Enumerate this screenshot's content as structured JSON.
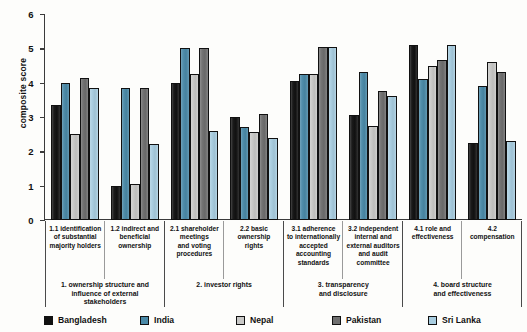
{
  "chart_data": {
    "type": "bar",
    "title": "",
    "xlabel": "",
    "ylabel": "composite score",
    "ylim": [
      0,
      6
    ],
    "yticks": [
      0,
      1,
      2,
      3,
      4,
      5,
      6
    ],
    "grid": false,
    "legend_position": "bottom",
    "categories": [
      "1.1 identification of substantial majority holders",
      "1.2 indirect and beneficial ownership",
      "2.1 shareholder meetings and voting procedures",
      "2.2 basic ownership rights",
      "3.1 adherence to internationally accepted accounting standards",
      "3.2 independent internal and external auditors and audit committee",
      "4.1 role and effectiveness",
      "4.2 compensation"
    ],
    "category_lines": [
      [
        "1.1 identification",
        "of substantial",
        "majority holders"
      ],
      [
        "1.2 indirect and",
        "beneficial",
        "ownership"
      ],
      [
        "2.1 shareholder",
        "meetings",
        "and voting",
        "procedures"
      ],
      [
        "2.2 basic",
        "ownership",
        "rights"
      ],
      [
        "3.1 adherence",
        "to internationally",
        "accepted",
        "accounting",
        "standards"
      ],
      [
        "3.2 independent",
        "internal and",
        "external auditors",
        "and audit",
        "committee"
      ],
      [
        "4.1 role and",
        "effectiveness"
      ],
      [
        "4.2 compensation"
      ]
    ],
    "category_groups": [
      {
        "label": "1. ownership structure and influence of external stakeholders",
        "lines": [
          "1. ownership structure and",
          "influence of external",
          "stakeholders"
        ],
        "span": 2
      },
      {
        "label": "2. investor rights",
        "lines": [
          "2. investor rights"
        ],
        "span": 2
      },
      {
        "label": "3. transparency and disclosure",
        "lines": [
          "3. transparency",
          "and disclosure"
        ],
        "span": 2
      },
      {
        "label": "4. board structure and effectiveness",
        "lines": [
          "4. board structure",
          "and effectiveness"
        ],
        "span": 2
      }
    ],
    "series": [
      {
        "name": "Bangladesh",
        "color": "#111111",
        "values": [
          3.35,
          1.0,
          4.0,
          3.0,
          4.05,
          3.05,
          5.1,
          2.25
        ]
      },
      {
        "name": "India",
        "color": "#4a8aa8",
        "values": [
          4.0,
          3.85,
          5.0,
          2.7,
          4.25,
          4.3,
          4.1,
          3.9
        ]
      },
      {
        "name": "Nepal",
        "color": "#c9c9c7",
        "values": [
          2.5,
          1.05,
          4.25,
          2.55,
          4.25,
          2.75,
          4.5,
          4.6
        ]
      },
      {
        "name": "Pakistan",
        "color": "#6f6f6f",
        "values": [
          4.15,
          3.85,
          5.0,
          3.1,
          5.05,
          3.75,
          4.65,
          4.3
        ]
      },
      {
        "name": "Sri Lanka",
        "color": "#a8cde0",
        "values": [
          3.85,
          2.2,
          2.6,
          2.4,
          5.05,
          3.6,
          5.1,
          2.3
        ]
      }
    ]
  }
}
